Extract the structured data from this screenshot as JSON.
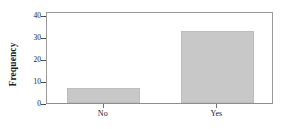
{
  "chart_data": {
    "type": "bar",
    "title": "",
    "xlabel": "",
    "ylabel": "Frequency",
    "categories": [
      "No",
      "Yes"
    ],
    "values": [
      7,
      33
    ],
    "ylim": [
      0,
      42
    ],
    "yticks": [
      0,
      10,
      20,
      30,
      40
    ],
    "ytick_labels": [
      "0",
      "10",
      "20",
      "30",
      "40"
    ],
    "grid": false,
    "legend": false,
    "legend_position": "none",
    "bar_color": "#c8c8c8",
    "bar_edge_color": "#bdbdbd",
    "frame_color": "#9a9a9a",
    "background": "#ffffff"
  }
}
